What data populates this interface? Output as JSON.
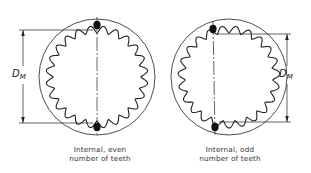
{
  "figure": {
    "left": {
      "caption_line1": "Internal, even",
      "caption_line2": "number of teeth",
      "dimension_label": "D",
      "dimension_subscript": "M",
      "teeth_count": 24
    },
    "right": {
      "caption_line1": "Internal, odd",
      "caption_line2": "number of teeth",
      "dimension_label": "D",
      "dimension_subscript": "M",
      "teeth_count": 23
    }
  },
  "colors": {
    "line": "#222222",
    "pin": "#111111",
    "background": "#ffffff"
  }
}
